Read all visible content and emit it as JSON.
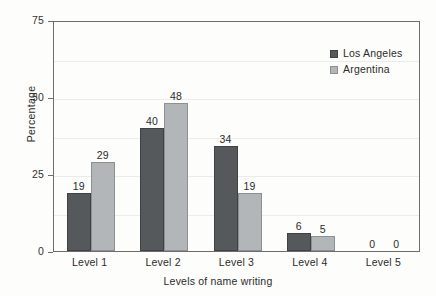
{
  "chart_data": {
    "type": "bar",
    "title": "",
    "subtitle": "",
    "categories": [
      "Level 1",
      "Level 2",
      "Level 3",
      "Level 4",
      "Level 5"
    ],
    "series": [
      {
        "name": "Los Angeles",
        "values": [
          19,
          40,
          34,
          6,
          0
        ],
        "color": "#55595b"
      },
      {
        "name": "Argentina",
        "values": [
          29,
          48,
          19,
          5,
          0
        ],
        "color": "#b3b6b8"
      }
    ],
    "xlabel": "Levels of name writing",
    "ylabel": "Percentage",
    "ylim": [
      0,
      75
    ],
    "yticks": [
      0,
      25,
      50,
      75
    ],
    "ytick_labels": [
      "0",
      "25",
      "50",
      "75"
    ],
    "minor_gridlines": [
      12.5,
      37.5,
      62.5
    ],
    "grid": true,
    "legend_position": "top-right",
    "data_labels": true,
    "data_label_format": "integer"
  },
  "axes": {
    "y_axis_title": "Percentage",
    "x_axis_title": "Levels of name writing"
  },
  "legend": {
    "entries": [
      {
        "label": "Los Angeles",
        "swatch": "dark-gray-swatch"
      },
      {
        "label": "Argentina",
        "swatch": "light-gray-swatch"
      }
    ]
  },
  "colors": {
    "series_los_angeles": "#55595b",
    "series_argentina": "#b3b6b8",
    "axis": "#6d6d6d",
    "gridline": "#ececea",
    "text": "#2b2b2b",
    "background": "#fdfdfb"
  }
}
